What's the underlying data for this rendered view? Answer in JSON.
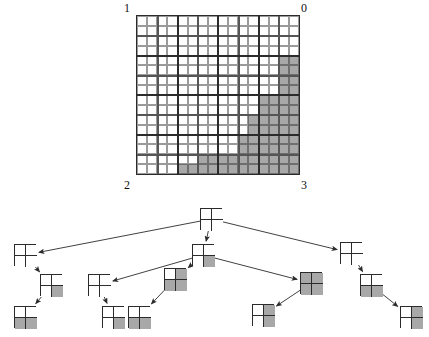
{
  "figure": {
    "type": "quadtree-decomposition",
    "fill_color": "#a8a8a8",
    "empty_color": "#ffffff",
    "line_color": "#2b2b2b"
  },
  "region": {
    "grid_size": 16,
    "corner_labels": {
      "top_left": "1",
      "top_right": "0",
      "bottom_left": "2",
      "bottom_right": "3"
    },
    "quadrant_order": [
      "1",
      "0",
      "2",
      "3"
    ],
    "filled_cells": [
      [
        14,
        4
      ],
      [
        15,
        4
      ],
      [
        14,
        5
      ],
      [
        15,
        5
      ],
      [
        14,
        6
      ],
      [
        15,
        6
      ],
      [
        14,
        7
      ],
      [
        15,
        7
      ],
      [
        12,
        8
      ],
      [
        13,
        8
      ],
      [
        14,
        8
      ],
      [
        15,
        8
      ],
      [
        12,
        9
      ],
      [
        13,
        9
      ],
      [
        14,
        9
      ],
      [
        15,
        9
      ],
      [
        11,
        10
      ],
      [
        12,
        10
      ],
      [
        13,
        10
      ],
      [
        14,
        10
      ],
      [
        15,
        10
      ],
      [
        11,
        11
      ],
      [
        12,
        11
      ],
      [
        13,
        11
      ],
      [
        14,
        11
      ],
      [
        15,
        11
      ],
      [
        10,
        12
      ],
      [
        11,
        12
      ],
      [
        12,
        12
      ],
      [
        13,
        12
      ],
      [
        14,
        12
      ],
      [
        15,
        12
      ],
      [
        10,
        13
      ],
      [
        11,
        13
      ],
      [
        12,
        13
      ],
      [
        13,
        13
      ],
      [
        14,
        13
      ],
      [
        15,
        13
      ],
      [
        6,
        14
      ],
      [
        7,
        14
      ],
      [
        8,
        14
      ],
      [
        9,
        14
      ],
      [
        10,
        14
      ],
      [
        11,
        14
      ],
      [
        12,
        14
      ],
      [
        13,
        14
      ],
      [
        14,
        14
      ],
      [
        15,
        14
      ],
      [
        4,
        15
      ],
      [
        5,
        15
      ],
      [
        6,
        15
      ],
      [
        7,
        15
      ],
      [
        8,
        15
      ],
      [
        9,
        15
      ],
      [
        10,
        15
      ],
      [
        11,
        15
      ],
      [
        12,
        15
      ],
      [
        13,
        15
      ],
      [
        14,
        15
      ],
      [
        15,
        15
      ]
    ],
    "subdivision_rules": {
      "heavy_horizontal_rows": [
        4,
        8,
        12
      ],
      "heavy_vertical_cols": [
        4,
        8,
        12
      ],
      "medium_horizontal_rows": [
        2,
        6,
        10,
        14
      ],
      "medium_vertical_cols": [
        2,
        6,
        10,
        14
      ]
    }
  },
  "tree": {
    "root": {
      "id": "root",
      "quads": [
        0,
        0,
        0,
        0
      ],
      "x": 200,
      "y": 8
    },
    "nodes": [
      {
        "id": "n-1",
        "quads": [
          0,
          0,
          0,
          0
        ],
        "x": 14,
        "y": 44
      },
      {
        "id": "n-1-2",
        "quads": [
          0,
          0,
          0,
          1
        ],
        "x": 40,
        "y": 74
      },
      {
        "id": "n-1-2-2",
        "quads": [
          0,
          0,
          1,
          1
        ],
        "x": 14,
        "y": 106
      },
      {
        "id": "n-0",
        "quads": [
          0,
          0,
          0,
          1
        ],
        "x": 192,
        "y": 44
      },
      {
        "id": "n-0-1",
        "quads": [
          0,
          0,
          0,
          0
        ],
        "x": 88,
        "y": 74
      },
      {
        "id": "n-0-1-2",
        "quads": [
          0,
          0,
          0,
          1
        ],
        "x": 102,
        "y": 106
      },
      {
        "id": "n-0-2",
        "quads": [
          0,
          1,
          1,
          1
        ],
        "x": 164,
        "y": 68
      },
      {
        "id": "n-0-2-1",
        "quads": [
          0,
          0,
          1,
          1
        ],
        "x": 128,
        "y": 106
      },
      {
        "id": "n-0-3",
        "quads": [
          1,
          1,
          1,
          1
        ],
        "x": 300,
        "y": 72
      },
      {
        "id": "n-0-3-1",
        "quads": [
          0,
          1,
          0,
          1
        ],
        "x": 252,
        "y": 104
      },
      {
        "id": "n-3",
        "quads": [
          0,
          0,
          0,
          0
        ],
        "x": 340,
        "y": 42
      },
      {
        "id": "n-3-2",
        "quads": [
          0,
          0,
          1,
          1
        ],
        "x": 360,
        "y": 74
      },
      {
        "id": "n-3-2-3",
        "quads": [
          0,
          1,
          0,
          1
        ],
        "x": 400,
        "y": 106
      }
    ],
    "edges": [
      [
        "root",
        "n-1"
      ],
      [
        "root",
        "n-0"
      ],
      [
        "root",
        "n-3"
      ],
      [
        "n-1",
        "n-1-2"
      ],
      [
        "n-1-2",
        "n-1-2-2"
      ],
      [
        "n-0",
        "n-0-1"
      ],
      [
        "n-0-1",
        "n-0-1-2"
      ],
      [
        "n-0",
        "n-0-2"
      ],
      [
        "n-0-2",
        "n-0-2-1"
      ],
      [
        "n-0",
        "n-0-3"
      ],
      [
        "n-0-3",
        "n-0-3-1"
      ],
      [
        "n-3",
        "n-3-2"
      ],
      [
        "n-3-2",
        "n-3-2-3"
      ]
    ]
  }
}
